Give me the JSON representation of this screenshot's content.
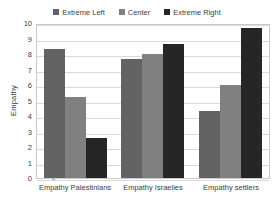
{
  "chart_data": {
    "type": "bar",
    "title": "",
    "xlabel": "",
    "ylabel": "Empathy",
    "ylim": [
      0,
      10
    ],
    "ytick_labels": [
      "10",
      "9",
      "8",
      "7",
      "6",
      "5",
      "4",
      "3",
      "2",
      "1",
      "0"
    ],
    "grid": true,
    "legend_position": "top-center",
    "categories": [
      "Empathy Palestinians",
      "Empathy Israelies",
      "Empathy settlers"
    ],
    "series": [
      {
        "name": "Extreme Left",
        "color": "#636363",
        "values": [
          8.35,
          7.7,
          4.35
        ]
      },
      {
        "name": "Center",
        "color": "#808080",
        "values": [
          5.25,
          8.0,
          6.0
        ]
      },
      {
        "name": "Extreme Right",
        "color": "#262626",
        "values": [
          2.6,
          8.65,
          9.65
        ]
      }
    ]
  }
}
